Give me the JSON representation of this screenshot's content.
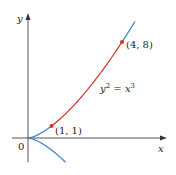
{
  "chart_data": {
    "type": "line",
    "title": "",
    "equation": "y² = x³",
    "xlabel": "x",
    "ylabel": "y",
    "origin_label": "0",
    "series": [
      {
        "name": "y² = x³ (upper branch)",
        "color": "#3a7fc4",
        "x": [
          0,
          0.5,
          1,
          2,
          3,
          4,
          4.55
        ],
        "y": [
          0,
          0.354,
          1,
          2.828,
          5.196,
          8,
          9.705
        ]
      },
      {
        "name": "y² = x³ (lower branch)",
        "color": "#3a7fc4",
        "x": [
          0,
          0.5,
          1,
          1.6
        ],
        "y": [
          0,
          -0.354,
          -1,
          -2.024
        ]
      },
      {
        "name": "arc from (1,1) to (4,8)",
        "color": "#d0342c",
        "x": [
          1,
          2,
          3,
          4
        ],
        "y": [
          1,
          2.828,
          5.196,
          8
        ]
      }
    ],
    "points": [
      {
        "label": "(1, 1)",
        "x": 1,
        "y": 1,
        "color": "#d0342c"
      },
      {
        "label": "(4, 8)",
        "x": 4,
        "y": 8,
        "color": "#d0342c"
      }
    ],
    "grid": false
  },
  "labels": {
    "x_axis": "x",
    "y_axis": "y",
    "origin": "0",
    "point1": "(1, 1)",
    "point2": "(4, 8)",
    "eq_y": "y",
    "eq_exp1": "2",
    "eq_mid": " = ",
    "eq_x": "x",
    "eq_exp2": "3"
  },
  "colors": {
    "curve": "#3a7fc4",
    "arc": "#d0342c",
    "axis": "#555555"
  }
}
